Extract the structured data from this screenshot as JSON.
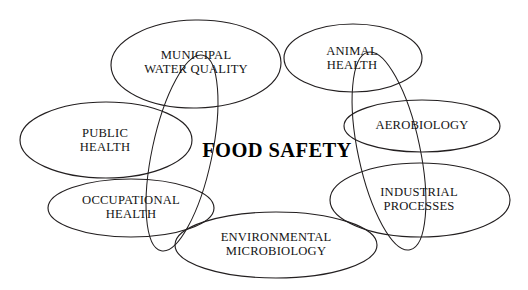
{
  "diagram": {
    "title": "FOOD SAFETY",
    "type": "overlapping-ellipse-venn",
    "background_color": "#ffffff",
    "stroke_color": "#231f20",
    "text_color": "#141414",
    "center": {
      "label": "FOOD SAFETY",
      "x": 277,
      "y": 150
    },
    "nodes": [
      {
        "id": "municipal-water-quality",
        "label": "MUNICIPAL\nWATER QUALITY",
        "cx": 196,
        "cy": 64,
        "rx": 85,
        "ry": 44,
        "rotation": -1,
        "label_x": 196,
        "label_y": 63
      },
      {
        "id": "animal-health",
        "label": "ANIMAL\nHEALTH",
        "cx": 353,
        "cy": 58,
        "rx": 69,
        "ry": 34,
        "rotation": 0,
        "label_x": 352,
        "label_y": 59
      },
      {
        "id": "aerobiology",
        "label": "AEROBIOLOGY",
        "cx": 422,
        "cy": 126,
        "rx": 78,
        "ry": 26,
        "rotation": 0,
        "label_x": 422,
        "label_y": 126
      },
      {
        "id": "industrial-processes",
        "label": "INDUSTRIAL\nPROCESSES",
        "cx": 420,
        "cy": 200,
        "rx": 90,
        "ry": 37,
        "rotation": 0,
        "label_x": 419,
        "label_y": 200
      },
      {
        "id": "environmental-microbiology",
        "label": "ENVIRONMENTAL\nMICROBIOLOGY",
        "cx": 276,
        "cy": 245,
        "rx": 101,
        "ry": 33,
        "rotation": 0,
        "label_x": 276,
        "label_y": 245
      },
      {
        "id": "occupational-health",
        "label": "OCCUPATIONAL\nHEALTH",
        "cx": 131,
        "cy": 208,
        "rx": 83,
        "ry": 29,
        "rotation": 0,
        "label_x": 131,
        "label_y": 208
      },
      {
        "id": "public-health",
        "label": "PUBLIC\nHEALTH",
        "cx": 106,
        "cy": 140,
        "rx": 86,
        "ry": 38,
        "rotation": 0,
        "label_x": 105,
        "label_y": 141
      }
    ],
    "connector_ellipses": [
      {
        "id": "left-vertical-loop",
        "cx": 182,
        "cy": 153,
        "rx": 30,
        "ry": 100,
        "rotation": 12
      },
      {
        "id": "right-vertical-loop",
        "cx": 389,
        "cy": 151,
        "rx": 31,
        "ry": 101,
        "rotation": -12
      }
    ]
  }
}
